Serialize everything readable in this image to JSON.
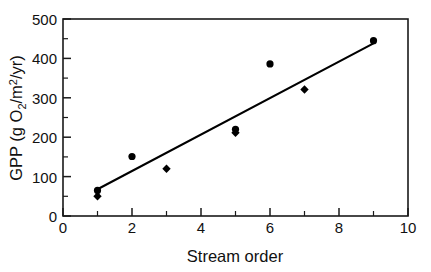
{
  "chart_data": {
    "type": "scatter",
    "title": "",
    "xlabel": "Stream order",
    "ylabel": "GPP (g O2/m2/yr)",
    "ylabel_parts": {
      "lead": "GPP (g O",
      "sub_o": "2",
      "mid": "/m",
      "sup_m": "2",
      "tail": "/yr)"
    },
    "xlim": [
      0,
      10
    ],
    "ylim": [
      0,
      500
    ],
    "xticks": [
      0,
      2,
      4,
      6,
      8,
      10
    ],
    "xticks_minor": [
      1,
      3,
      5,
      7,
      9
    ],
    "yticks": [
      0,
      100,
      200,
      300,
      400,
      500
    ],
    "yticks_minor": [
      50,
      150,
      250,
      350,
      450
    ],
    "xtick_labels": [
      "0",
      "2",
      "4",
      "6",
      "8",
      "10"
    ],
    "ytick_labels": [
      "0",
      "100",
      "200",
      "300",
      "400",
      "500"
    ],
    "grid": false,
    "legend": "none",
    "frame": "box",
    "series": [
      {
        "name": "circle-points",
        "marker": "circle",
        "points": [
          {
            "x": 1,
            "y": 65
          },
          {
            "x": 2,
            "y": 151
          },
          {
            "x": 5,
            "y": 220
          },
          {
            "x": 6,
            "y": 386
          },
          {
            "x": 9,
            "y": 445
          }
        ]
      },
      {
        "name": "diamond-points",
        "marker": "diamond",
        "points": [
          {
            "x": 1,
            "y": 50
          },
          {
            "x": 3,
            "y": 120
          },
          {
            "x": 5,
            "y": 211
          },
          {
            "x": 7,
            "y": 321
          }
        ]
      }
    ],
    "fit_line": {
      "name": "regression-line",
      "x_start": 1,
      "y_start": 68,
      "x_end": 9,
      "y_end": 438
    }
  },
  "axes": {
    "x_title": "Stream order",
    "y_title": "GPP (g O2/m2/yr)"
  },
  "colors": {
    "marker": "#000000",
    "line": "#000000",
    "axis": "#1a1a1a",
    "background": "#ffffff",
    "text": "#111111"
  }
}
